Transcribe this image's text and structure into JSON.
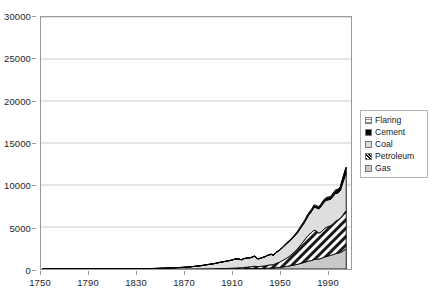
{
  "chart_data": {
    "type": "area",
    "stacked": true,
    "title": "",
    "subtitle": "",
    "xlabel": "",
    "ylabel": "",
    "xlim": [
      1750,
      2010
    ],
    "ylim": [
      0,
      30000
    ],
    "grid": true,
    "grid_axis": "y",
    "legend_position": "right",
    "x_tick_labels": [
      "1750",
      "1790",
      "1830",
      "1870",
      "1910",
      "1950",
      "1990"
    ],
    "x_tick_values": [
      1750,
      1790,
      1830,
      1870,
      1910,
      1950,
      1990
    ],
    "y_tick_labels": [
      "0",
      "5000",
      "10000",
      "15000",
      "20000",
      "25000",
      "30000"
    ],
    "y_tick_values": [
      0,
      5000,
      10000,
      15000,
      20000,
      25000,
      30000
    ],
    "legend_entries": [
      {
        "label": "Flaring",
        "swatch": "grid-pattern",
        "color": "#f2f2f2"
      },
      {
        "label": "Cement",
        "swatch": "solid-black",
        "color": "#000000"
      },
      {
        "label": "Coal",
        "swatch": "light-gray",
        "color": "#dcdcdc"
      },
      {
        "label": "Petroleum",
        "swatch": "diagonal-hatch",
        "color": "#ffffff"
      },
      {
        "label": "Gas",
        "swatch": "medium-gray",
        "color": "#c8c8c8"
      }
    ],
    "series_order_bottom_to_top": [
      "Gas",
      "Petroleum",
      "Coal",
      "Cement",
      "Flaring"
    ],
    "x": [
      1751,
      1760,
      1770,
      1780,
      1790,
      1800,
      1810,
      1820,
      1830,
      1840,
      1850,
      1860,
      1870,
      1875,
      1880,
      1885,
      1890,
      1895,
      1900,
      1905,
      1910,
      1913,
      1916,
      1918,
      1920,
      1923,
      1926,
      1929,
      1932,
      1935,
      1938,
      1940,
      1943,
      1945,
      1947,
      1950,
      1953,
      1956,
      1959,
      1962,
      1965,
      1968,
      1971,
      1974,
      1977,
      1979,
      1981,
      1983,
      1985,
      1987,
      1989,
      1991,
      1993,
      1995,
      1997,
      1999,
      2001,
      2003,
      2005,
      2006
    ],
    "series": [
      {
        "name": "Gas",
        "values": [
          0,
          0,
          0,
          0,
          0,
          0,
          0,
          0,
          0,
          0,
          0,
          0,
          0,
          0,
          0,
          1,
          2,
          4,
          7,
          10,
          15,
          20,
          26,
          28,
          35,
          45,
          53,
          70,
          57,
          65,
          80,
          95,
          115,
          125,
          160,
          195,
          250,
          310,
          380,
          470,
          560,
          670,
          800,
          930,
          1020,
          1130,
          1170,
          1180,
          1260,
          1380,
          1480,
          1560,
          1620,
          1710,
          1820,
          1880,
          1960,
          2100,
          2310,
          2400
        ]
      },
      {
        "name": "Petroleum",
        "values": [
          0,
          0,
          0,
          0,
          0,
          0,
          0,
          0,
          0,
          0,
          0,
          1,
          3,
          6,
          10,
          14,
          20,
          28,
          40,
          55,
          78,
          95,
          110,
          115,
          135,
          175,
          210,
          260,
          230,
          260,
          300,
          340,
          390,
          390,
          500,
          620,
          790,
          980,
          1200,
          1500,
          1820,
          2240,
          2650,
          3060,
          3320,
          3500,
          3340,
          3100,
          3150,
          3330,
          3460,
          3500,
          3540,
          3680,
          3870,
          3950,
          4070,
          4290,
          4480,
          4560
        ]
      },
      {
        "name": "Coal",
        "values": [
          3,
          4,
          5,
          7,
          9,
          12,
          16,
          22,
          32,
          50,
          80,
          130,
          200,
          250,
          320,
          400,
          510,
          600,
          740,
          850,
          960,
          1080,
          1050,
          950,
          1050,
          1080,
          1080,
          1180,
          890,
          990,
          1080,
          1170,
          1230,
          1100,
          1280,
          1400,
          1540,
          1730,
          1770,
          1830,
          1900,
          1990,
          2090,
          2310,
          2530,
          2720,
          2770,
          2870,
          3050,
          3180,
          3230,
          3170,
          3140,
          3260,
          3310,
          3200,
          3280,
          3810,
          4280,
          4440
        ]
      },
      {
        "name": "Cement",
        "values": [
          0,
          0,
          0,
          0,
          0,
          0,
          0,
          0,
          0,
          0,
          0,
          0,
          0,
          0,
          0,
          0,
          1,
          2,
          3,
          5,
          8,
          10,
          10,
          8,
          12,
          16,
          20,
          25,
          15,
          18,
          24,
          25,
          24,
          16,
          26,
          34,
          44,
          55,
          67,
          82,
          97,
          114,
          132,
          152,
          168,
          180,
          182,
          190,
          210,
          230,
          250,
          265,
          280,
          310,
          350,
          390,
          430,
          520,
          620,
          680
        ]
      },
      {
        "name": "Flaring",
        "values": [
          0,
          0,
          0,
          0,
          0,
          0,
          0,
          0,
          0,
          0,
          0,
          0,
          0,
          0,
          0,
          0,
          0,
          0,
          0,
          0,
          0,
          0,
          0,
          0,
          2,
          4,
          6,
          9,
          8,
          10,
          13,
          15,
          18,
          20,
          26,
          32,
          42,
          55,
          70,
          85,
          100,
          115,
          125,
          130,
          125,
          120,
          110,
          100,
          95,
          90,
          85,
          80,
          75,
          72,
          70,
          68,
          66,
          65,
          64,
          64
        ]
      }
    ],
    "total_peak_value": 27000,
    "total_peak_year": 2006
  }
}
